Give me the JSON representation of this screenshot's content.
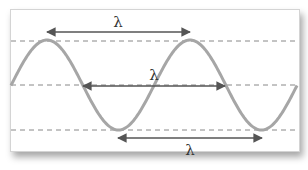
{
  "diagram": {
    "colors": {
      "wave": "#a6a6a6",
      "arrow": "#555555",
      "dashed_line": "#888888",
      "label": "#333333",
      "paper": "#ffffff"
    },
    "reference_lines": [
      {
        "name": "crest-line",
        "y": 41
      },
      {
        "name": "equilibrium-line",
        "y": 85
      },
      {
        "name": "trough-line",
        "y": 130
      }
    ],
    "wave": {
      "type": "sine",
      "amplitude_px": 45,
      "wavelength_px": 143,
      "peaks_x": [
        47,
        190
      ],
      "troughs_x": [
        118,
        262
      ]
    },
    "measurements": [
      {
        "name": "crest-to-crest",
        "label": "λ",
        "x1": 47,
        "x2": 190,
        "y": 32,
        "label_x": 118,
        "label_y": 27
      },
      {
        "name": "node-to-node",
        "label": "λ",
        "x1": 83,
        "x2": 225,
        "y": 86,
        "label_x": 154,
        "label_y": 80
      },
      {
        "name": "trough-to-trough",
        "label": "λ",
        "x1": 118,
        "x2": 262,
        "y": 138,
        "label_x": 190,
        "label_y": 155
      }
    ]
  }
}
